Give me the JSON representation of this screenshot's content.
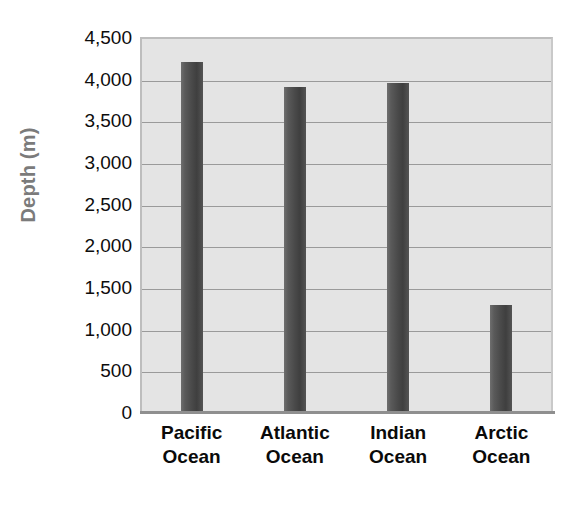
{
  "chart_data": {
    "type": "bar",
    "title": "",
    "xlabel": "",
    "ylabel": "Depth (m)",
    "categories": [
      "Pacific Ocean",
      "Atlantic Ocean",
      "Indian Ocean",
      "Arctic Ocean"
    ],
    "category_lines": [
      [
        "Pacific",
        "Ocean"
      ],
      [
        "Atlantic",
        "Ocean"
      ],
      [
        "Indian",
        "Ocean"
      ],
      [
        "Arctic",
        "Ocean"
      ]
    ],
    "values": [
      4200,
      3900,
      3950,
      1280
    ],
    "ylim": [
      0,
      4500
    ],
    "ytick_values": [
      0,
      500,
      1000,
      1500,
      2000,
      2500,
      3000,
      3500,
      4000,
      4500
    ],
    "ytick_labels": [
      "0",
      "500",
      "1,000",
      "1,500",
      "2,000",
      "2,500",
      "3,000",
      "3,500",
      "4,000",
      "4,500"
    ],
    "grid": true,
    "legend": false,
    "legend_position": "none",
    "colors": {
      "bar": "#4a4a4a",
      "plot_background": "#e4e4e4",
      "gridline": "#9a9a9a",
      "axis_line": "#8f8f8f",
      "tick_text": "#0d0d0d",
      "axis_title_text": "#7b7b7b",
      "page_background": "#ffffff"
    }
  }
}
